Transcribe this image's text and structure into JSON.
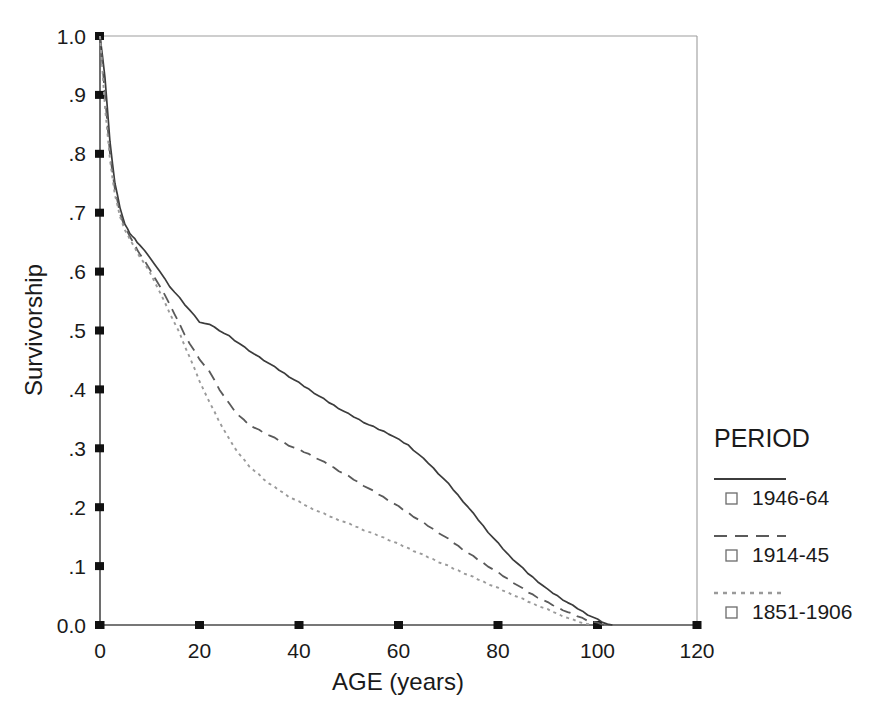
{
  "chart_data": {
    "type": "line",
    "title": "",
    "xlabel": "AGE (years)",
    "ylabel": "Survivorship",
    "xlim": [
      0,
      120
    ],
    "ylim": [
      0.0,
      1.0
    ],
    "xticks": [
      0,
      20,
      40,
      60,
      80,
      100,
      120
    ],
    "xtick_labels": [
      "0",
      "20",
      "40",
      "60",
      "80",
      "100",
      "120"
    ],
    "yticks": [
      0.0,
      0.1,
      0.2,
      0.3,
      0.4,
      0.5,
      0.6,
      0.7,
      0.8,
      0.9,
      1.0
    ],
    "ytick_labels": [
      "0.0",
      ".1",
      ".2",
      ".3",
      ".4",
      ".5",
      ".6",
      ".7",
      ".8",
      ".9",
      "1.0"
    ],
    "grid": false,
    "legend_position": "right",
    "legend_title": "PERIOD",
    "series": [
      {
        "name": "1946-64",
        "style": "solid",
        "color": "#3c3c3c",
        "x": [
          0,
          1,
          2,
          3,
          4,
          5,
          6,
          7,
          8,
          10,
          12,
          14,
          16,
          18,
          20,
          22,
          24,
          26,
          28,
          30,
          34,
          38,
          42,
          46,
          50,
          54,
          58,
          62,
          66,
          70,
          74,
          78,
          82,
          86,
          90,
          94,
          98,
          101,
          103
        ],
        "y": [
          1.0,
          0.93,
          0.82,
          0.75,
          0.71,
          0.68,
          0.665,
          0.655,
          0.645,
          0.625,
          0.6,
          0.575,
          0.555,
          0.535,
          0.515,
          0.51,
          0.5,
          0.49,
          0.478,
          0.466,
          0.444,
          0.422,
          0.4,
          0.378,
          0.358,
          0.34,
          0.325,
          0.305,
          0.275,
          0.24,
          0.2,
          0.158,
          0.12,
          0.088,
          0.06,
          0.038,
          0.018,
          0.005,
          0.0
        ]
      },
      {
        "name": "1914-45",
        "style": "dashed",
        "color": "#5a5a5a",
        "x": [
          0,
          1,
          2,
          3,
          4,
          5,
          6,
          7,
          8,
          10,
          12,
          14,
          16,
          18,
          20,
          22,
          24,
          26,
          28,
          30,
          34,
          38,
          42,
          46,
          50,
          54,
          58,
          62,
          66,
          70,
          74,
          78,
          82,
          86,
          90,
          94,
          98,
          100,
          102
        ],
        "y": [
          1.0,
          0.9,
          0.8,
          0.74,
          0.7,
          0.675,
          0.66,
          0.645,
          0.63,
          0.605,
          0.575,
          0.545,
          0.51,
          0.478,
          0.452,
          0.43,
          0.4,
          0.375,
          0.355,
          0.34,
          0.322,
          0.305,
          0.29,
          0.272,
          0.252,
          0.232,
          0.212,
          0.19,
          0.168,
          0.146,
          0.122,
          0.1,
          0.078,
          0.056,
          0.038,
          0.022,
          0.008,
          0.003,
          0.0
        ]
      },
      {
        "name": "1851-1906",
        "style": "dotted",
        "color": "#9a9a9a",
        "x": [
          0,
          1,
          2,
          3,
          4,
          5,
          6,
          7,
          8,
          10,
          12,
          14,
          16,
          18,
          20,
          22,
          24,
          26,
          28,
          30,
          34,
          38,
          42,
          46,
          50,
          54,
          58,
          62,
          66,
          70,
          74,
          78,
          82,
          86,
          90,
          94,
          97,
          99
        ],
        "y": [
          1.0,
          0.88,
          0.79,
          0.73,
          0.695,
          0.67,
          0.655,
          0.64,
          0.625,
          0.6,
          0.565,
          0.53,
          0.495,
          0.455,
          0.415,
          0.378,
          0.345,
          0.315,
          0.29,
          0.27,
          0.24,
          0.218,
          0.2,
          0.185,
          0.172,
          0.158,
          0.145,
          0.13,
          0.115,
          0.1,
          0.085,
          0.07,
          0.055,
          0.04,
          0.026,
          0.012,
          0.003,
          0.0
        ]
      }
    ]
  },
  "legend": {
    "title": "PERIOD",
    "entries": [
      {
        "label": "1946-64",
        "style": "solid"
      },
      {
        "label": "1914-45",
        "style": "dashed"
      },
      {
        "label": "1851-1906",
        "style": "dotted"
      }
    ]
  },
  "axes": {
    "x_title": "AGE (years)",
    "y_title": "Survivorship"
  }
}
